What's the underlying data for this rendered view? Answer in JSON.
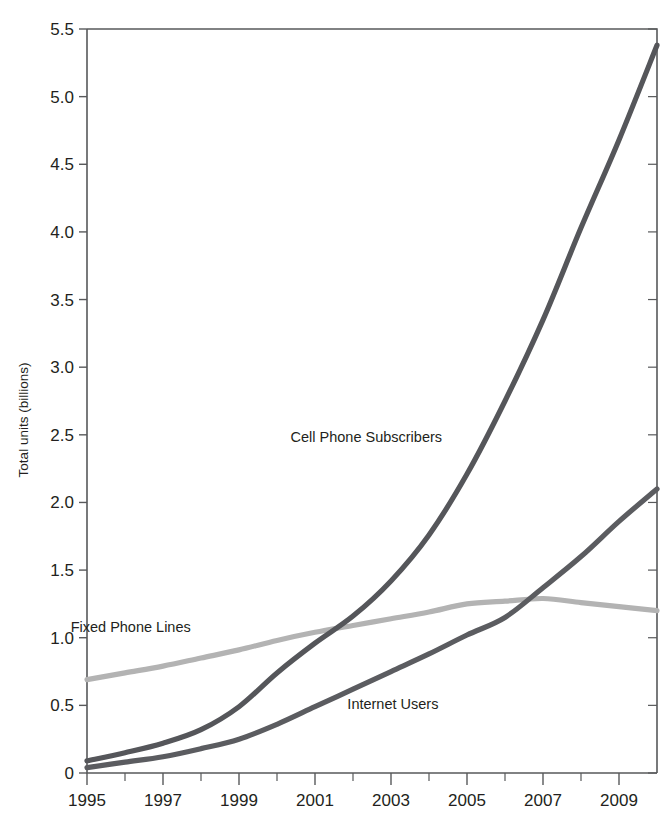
{
  "chart_data": {
    "type": "line",
    "title": "",
    "subtitle": "",
    "xlabel": "",
    "ylabel": "Total units (billions)",
    "xlim": [
      1995,
      2010
    ],
    "ylim": [
      0,
      5.5
    ],
    "grid": false,
    "legend_position": "inline-annotations",
    "x": [
      1995,
      1996,
      1997,
      1998,
      1999,
      2000,
      2001,
      2002,
      2003,
      2004,
      2005,
      2006,
      2007,
      2008,
      2009,
      2010
    ],
    "x_tick_labels": [
      "1995",
      "1997",
      "1999",
      "2001",
      "2003",
      "2005",
      "2007",
      "2009"
    ],
    "x_tick_values": [
      1995,
      1997,
      1999,
      2001,
      2003,
      2005,
      2007,
      2009
    ],
    "x_minor_tick_values": [
      1996,
      1998,
      2000,
      2002,
      2004,
      2006,
      2008,
      2010
    ],
    "y_tick_labels": [
      "0",
      "0.5",
      "1.0",
      "1.5",
      "2.0",
      "2.5",
      "3.0",
      "3.5",
      "4.0",
      "4.5",
      "5.0",
      "5.5"
    ],
    "y_tick_values": [
      0,
      0.5,
      1.0,
      1.5,
      2.0,
      2.5,
      3.0,
      3.5,
      4.0,
      4.5,
      5.0,
      5.5
    ],
    "series": [
      {
        "name": "Cell Phone Subscribers",
        "color": "#55565a",
        "label_x": 2002.35,
        "label_y": 2.45,
        "values": [
          0.09,
          0.15,
          0.22,
          0.32,
          0.49,
          0.74,
          0.96,
          1.16,
          1.42,
          1.76,
          2.21,
          2.75,
          3.35,
          4.03,
          4.68,
          5.38
        ]
      },
      {
        "name": "Fixed Phone Lines",
        "color": "#b3b3b3",
        "label_x": 1996.15,
        "label_y": 1.04,
        "values": [
          0.69,
          0.74,
          0.79,
          0.85,
          0.91,
          0.98,
          1.04,
          1.09,
          1.14,
          1.19,
          1.25,
          1.27,
          1.29,
          1.26,
          1.23,
          1.2
        ]
      },
      {
        "name": "Internet Users",
        "color": "#5b5c60",
        "label_x": 2003.05,
        "label_y": 0.47,
        "values": [
          0.04,
          0.08,
          0.12,
          0.18,
          0.25,
          0.36,
          0.49,
          0.62,
          0.75,
          0.88,
          1.02,
          1.15,
          1.37,
          1.6,
          1.86,
          2.1
        ]
      }
    ]
  },
  "axes": {
    "y_axis_title": "Total units (billions)"
  }
}
